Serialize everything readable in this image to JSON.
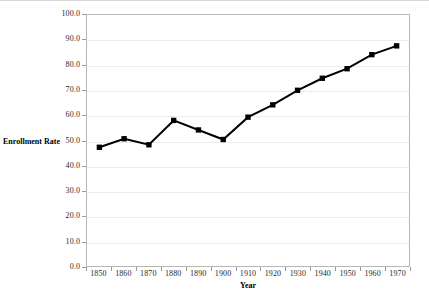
{
  "chart_data": {
    "type": "line",
    "title": "",
    "xlabel": "Year",
    "ylabel": "Enrollment Rate",
    "categories": [
      "1850",
      "1860",
      "1870",
      "1880",
      "1890",
      "1900",
      "1910",
      "1920",
      "1930",
      "1940",
      "1950",
      "1960",
      "1970"
    ],
    "values": [
      47.3,
      50.7,
      48.3,
      58.0,
      54.2,
      50.4,
      59.3,
      64.2,
      70.0,
      74.8,
      78.6,
      84.2,
      87.7
    ],
    "series": [
      {
        "name": "Enrollment Rate",
        "values": [
          47.3,
          50.7,
          48.3,
          58.0,
          54.2,
          50.4,
          59.3,
          64.2,
          70.0,
          74.8,
          78.6,
          84.2,
          87.7
        ]
      }
    ],
    "ylim": [
      0.0,
      100.0
    ],
    "ytick_step": 10.0,
    "ytick_labels": [
      "0.0",
      "10.0",
      "20.0",
      "30.0",
      "40.0",
      "50.0",
      "60.0",
      "70.0",
      "80.0",
      "90.0",
      "100.0"
    ],
    "xtick_labels": [
      "1850",
      "1860",
      "1870",
      "1880",
      "1890",
      "1900",
      "1910",
      "1920",
      "1930",
      "1940",
      "1950",
      "1960",
      "1970"
    ],
    "grid": true,
    "grid_axis": "y",
    "legend": false,
    "legend_position": "none",
    "marker": "square",
    "line_color": "#000000",
    "marker_color": "#000000",
    "grid_color": "#ececec",
    "axis_color": "#b7b7b7",
    "background_color": "#ffffff"
  }
}
